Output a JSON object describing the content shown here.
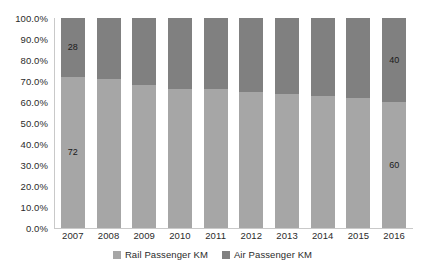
{
  "chart_data": {
    "type": "bar",
    "subtype": "stacked-100-percent",
    "title": "",
    "xlabel": "",
    "ylabel": "",
    "categories": [
      "2007",
      "2008",
      "2009",
      "2010",
      "2011",
      "2012",
      "2013",
      "2014",
      "2015",
      "2016"
    ],
    "series": [
      {
        "name": "Rail Passenger KM",
        "color": "#a6a6a6",
        "values": [
          72,
          71,
          68,
          66,
          66,
          65,
          64,
          63,
          62,
          60
        ]
      },
      {
        "name": "Air Passenger KM",
        "color": "#808080",
        "values": [
          28,
          29,
          32,
          34,
          34,
          35,
          36,
          37,
          38,
          40
        ]
      }
    ],
    "data_labels": [
      {
        "category": "2007",
        "series": "Rail Passenger KM",
        "text": "72"
      },
      {
        "category": "2007",
        "series": "Air Passenger KM",
        "text": "28"
      },
      {
        "category": "2016",
        "series": "Rail Passenger KM",
        "text": "60"
      },
      {
        "category": "2016",
        "series": "Air Passenger KM",
        "text": "40"
      }
    ],
    "ylim": [
      0,
      100
    ],
    "y_ticks": [
      "0.0%",
      "10.0%",
      "20.0%",
      "30.0%",
      "40.0%",
      "50.0%",
      "60.0%",
      "70.0%",
      "80.0%",
      "90.0%",
      "100.0%"
    ],
    "y_tick_values": [
      0,
      10,
      20,
      30,
      40,
      50,
      60,
      70,
      80,
      90,
      100
    ],
    "grid": false,
    "legend_position": "bottom",
    "legend": [
      "Rail Passenger KM",
      "Air Passenger KM"
    ]
  },
  "colors": {
    "rail": "#a6a6a6",
    "air": "#808080",
    "axis": "#c9c9c9",
    "text": "#2b2b2b",
    "background": "#ffffff"
  }
}
